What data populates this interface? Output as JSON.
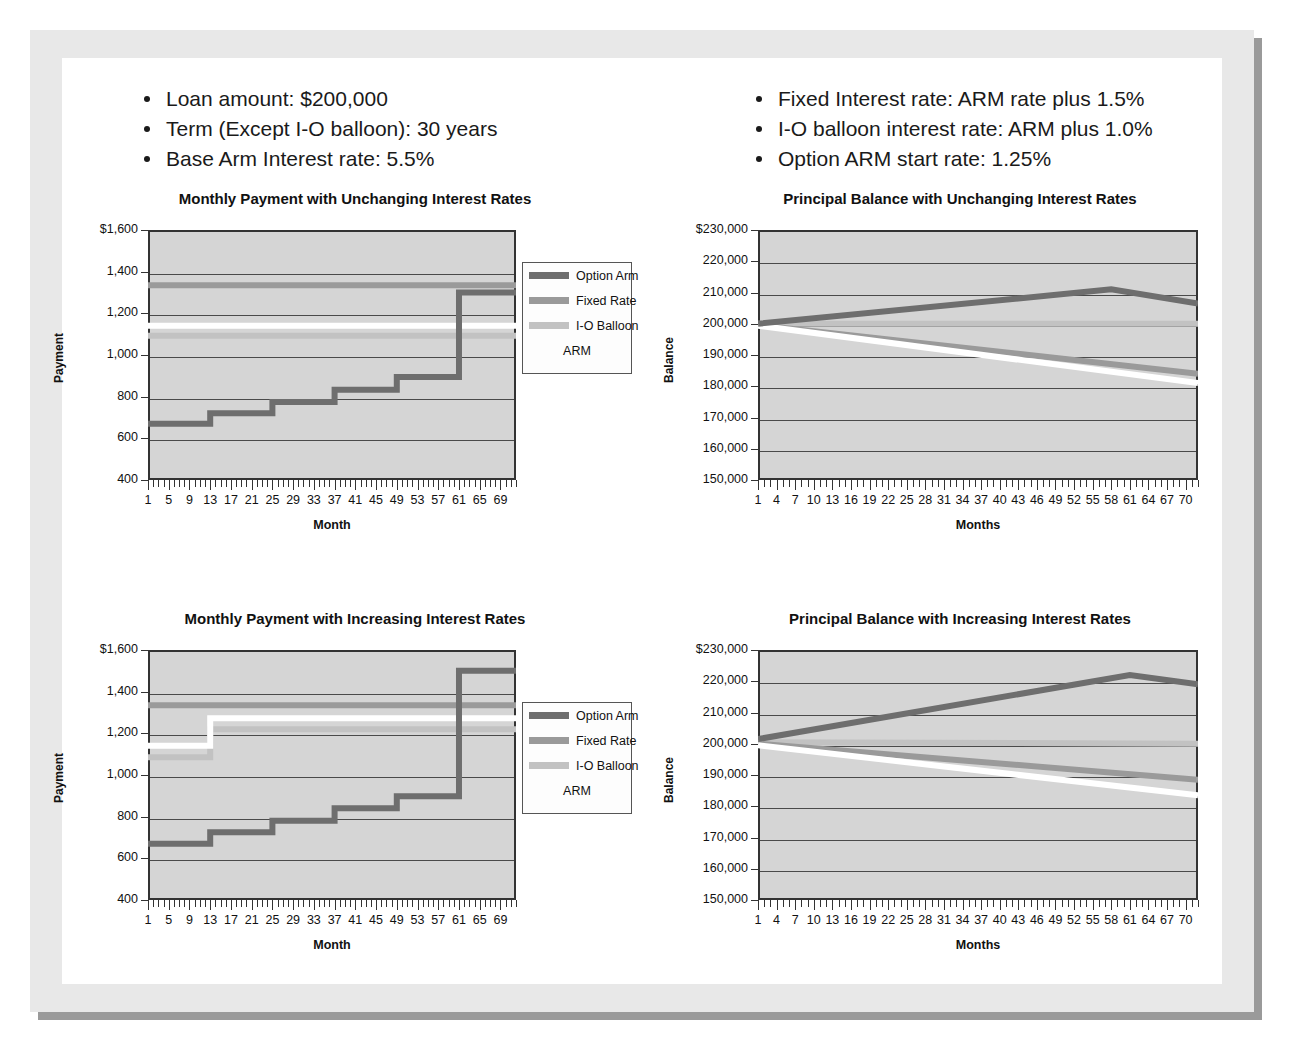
{
  "slide": {
    "bullets_left": [
      "Loan amount: $200,000",
      "Term (Except I-O balloon): 30 years",
      "Base Arm Interest rate: 5.5%"
    ],
    "bullets_right": [
      "Fixed Interest rate: ARM rate plus 1.5%",
      "I-O balloon interest rate: ARM plus 1.0%",
      "Option ARM start rate: 1.25%"
    ]
  },
  "colors": {
    "option_arm": "#6e6e6e",
    "fixed_rate": "#9a9a9a",
    "io_balloon": "#c2c2c2",
    "arm": "#ffffff",
    "plot_bg": "#d5d5d5",
    "axis": "#333333",
    "page_border": "#e8e8e8",
    "shadow": "#9a9a9a"
  },
  "legend": {
    "items": [
      {
        "label": "Option Arm",
        "color": "#6e6e6e"
      },
      {
        "label": "Fixed Rate",
        "color": "#9a9a9a"
      },
      {
        "label": "I-O Balloon",
        "color": "#c2c2c2"
      },
      {
        "label": "ARM",
        "color": "#ffffff"
      }
    ]
  },
  "chart_data": [
    {
      "id": "payment-unchanging",
      "type": "line",
      "title": "Monthly Payment with Unchanging Interest Rates",
      "xlabel": "Month",
      "ylabel": "Payment",
      "ylim": [
        400,
        1600
      ],
      "yticks": [
        400,
        600,
        800,
        1000,
        1200,
        1400,
        1600
      ],
      "ytick_labels": [
        "400",
        "600",
        "800",
        "1,000",
        "1,200",
        "1,400",
        "$1,600"
      ],
      "xlim": [
        1,
        72
      ],
      "xticks": [
        1,
        5,
        9,
        13,
        17,
        21,
        25,
        29,
        33,
        37,
        41,
        45,
        49,
        53,
        57,
        61,
        65,
        69
      ],
      "xtick_labels": [
        "1",
        "5",
        "9",
        "13",
        "17",
        "21",
        "25",
        "29",
        "33",
        "37",
        "41",
        "45",
        "49",
        "53",
        "57",
        "61",
        "65",
        "69"
      ],
      "grid": true,
      "legend_position": "right",
      "series": [
        {
          "name": "Option Arm",
          "color": "#6e6e6e",
          "style": "step",
          "x": [
            1,
            13,
            25,
            37,
            49,
            61,
            72
          ],
          "values": [
            670,
            720,
            775,
            833,
            895,
            1300,
            1300
          ]
        },
        {
          "name": "Fixed Rate",
          "color": "#9a9a9a",
          "style": "flat",
          "x": [
            1,
            72
          ],
          "values": [
            1335,
            1335
          ]
        },
        {
          "name": "I-O Balloon",
          "color": "#c2c2c2",
          "style": "flat",
          "x": [
            1,
            72
          ],
          "values": [
            1092,
            1092
          ]
        },
        {
          "name": "ARM",
          "color": "#ffffff",
          "style": "flat",
          "x": [
            1,
            72
          ],
          "values": [
            1140,
            1140
          ]
        }
      ]
    },
    {
      "id": "balance-unchanging",
      "type": "line",
      "title": "Principal Balance with Unchanging Interest Rates",
      "xlabel": "Months",
      "ylabel": "Balance",
      "ylim": [
        150000,
        230000
      ],
      "yticks": [
        150000,
        160000,
        170000,
        180000,
        190000,
        200000,
        210000,
        220000,
        230000
      ],
      "ytick_labels": [
        "150,000",
        "160,000",
        "170,000",
        "180,000",
        "190,000",
        "200,000",
        "210,000",
        "220,000",
        "$230,000"
      ],
      "xlim": [
        1,
        72
      ],
      "xticks": [
        1,
        4,
        7,
        10,
        13,
        16,
        19,
        22,
        25,
        28,
        31,
        34,
        37,
        40,
        43,
        46,
        49,
        52,
        55,
        58,
        61,
        64,
        67,
        70
      ],
      "xtick_labels": [
        "1",
        "4",
        "7",
        "10",
        "13",
        "16",
        "19",
        "22",
        "25",
        "28",
        "31",
        "34",
        "37",
        "40",
        "43",
        "46",
        "49",
        "52",
        "55",
        "58",
        "61",
        "64",
        "67",
        "70"
      ],
      "grid": true,
      "legend_position": "none",
      "series": [
        {
          "name": "Option Arm",
          "color": "#6e6e6e",
          "style": "line",
          "x": [
            1,
            58,
            72
          ],
          "values": [
            200000,
            211000,
            206500
          ]
        },
        {
          "name": "I-O Balloon",
          "color": "#c2c2c2",
          "style": "line",
          "x": [
            1,
            72
          ],
          "values": [
            200000,
            200000
          ]
        },
        {
          "name": "Fixed Rate",
          "color": "#9a9a9a",
          "style": "line",
          "x": [
            1,
            72
          ],
          "values": [
            199600,
            184000
          ]
        },
        {
          "name": "ARM",
          "color": "#ffffff",
          "style": "line",
          "x": [
            1,
            72
          ],
          "values": [
            199400,
            181000
          ]
        }
      ]
    },
    {
      "id": "payment-increasing",
      "type": "line",
      "title": "Monthly Payment with Increasing Interest Rates",
      "xlabel": "Month",
      "ylabel": "Payment",
      "ylim": [
        400,
        1600
      ],
      "yticks": [
        400,
        600,
        800,
        1000,
        1200,
        1400,
        1600
      ],
      "ytick_labels": [
        "400",
        "600",
        "800",
        "1,000",
        "1,200",
        "1,400",
        "$1,600"
      ],
      "xlim": [
        1,
        72
      ],
      "xticks": [
        1,
        5,
        9,
        13,
        17,
        21,
        25,
        29,
        33,
        37,
        41,
        45,
        49,
        53,
        57,
        61,
        65,
        69
      ],
      "xtick_labels": [
        "1",
        "5",
        "9",
        "13",
        "17",
        "21",
        "25",
        "29",
        "33",
        "37",
        "41",
        "45",
        "49",
        "53",
        "57",
        "61",
        "65",
        "69"
      ],
      "grid": true,
      "legend_position": "right",
      "series": [
        {
          "name": "Option Arm",
          "color": "#6e6e6e",
          "style": "step",
          "x": [
            1,
            13,
            25,
            37,
            49,
            61,
            72
          ],
          "values": [
            670,
            725,
            780,
            840,
            898,
            1500,
            1500
          ]
        },
        {
          "name": "Fixed Rate",
          "color": "#9a9a9a",
          "style": "flat",
          "x": [
            1,
            72
          ],
          "values": [
            1335,
            1335
          ]
        },
        {
          "name": "I-O Balloon",
          "color": "#c2c2c2",
          "style": "step",
          "x": [
            1,
            13,
            72
          ],
          "values": [
            1085,
            1220,
            1220
          ]
        },
        {
          "name": "ARM",
          "color": "#ffffff",
          "style": "step",
          "x": [
            1,
            13,
            72
          ],
          "values": [
            1140,
            1272,
            1272
          ]
        }
      ]
    },
    {
      "id": "balance-increasing",
      "type": "line",
      "title": "Principal Balance with Increasing Interest Rates",
      "xlabel": "Months",
      "ylabel": "Balance",
      "ylim": [
        150000,
        230000
      ],
      "yticks": [
        150000,
        160000,
        170000,
        180000,
        190000,
        200000,
        210000,
        220000,
        230000
      ],
      "ytick_labels": [
        "150,000",
        "160,000",
        "170,000",
        "180,000",
        "190,000",
        "200,000",
        "210,000",
        "220,000",
        "$230,000"
      ],
      "xlim": [
        1,
        72
      ],
      "xticks": [
        1,
        4,
        7,
        10,
        13,
        16,
        19,
        22,
        25,
        28,
        31,
        34,
        37,
        40,
        43,
        46,
        49,
        52,
        55,
        58,
        61,
        64,
        67,
        70
      ],
      "xtick_labels": [
        "1",
        "4",
        "7",
        "10",
        "13",
        "16",
        "19",
        "22",
        "25",
        "28",
        "31",
        "34",
        "37",
        "40",
        "43",
        "46",
        "49",
        "52",
        "55",
        "58",
        "61",
        "64",
        "67",
        "70"
      ],
      "grid": true,
      "legend_position": "none",
      "series": [
        {
          "name": "Option Arm",
          "color": "#6e6e6e",
          "style": "line",
          "x": [
            1,
            61,
            72
          ],
          "values": [
            201500,
            222000,
            219000
          ]
        },
        {
          "name": "I-O Balloon",
          "color": "#c2c2c2",
          "style": "line",
          "x": [
            1,
            72
          ],
          "values": [
            200500,
            200000
          ]
        },
        {
          "name": "Fixed Rate",
          "color": "#9a9a9a",
          "style": "line",
          "x": [
            1,
            72
          ],
          "values": [
            200000,
            188500
          ]
        },
        {
          "name": "ARM",
          "color": "#ffffff",
          "style": "line",
          "x": [
            1,
            72
          ],
          "values": [
            199500,
            183500
          ]
        }
      ]
    }
  ]
}
